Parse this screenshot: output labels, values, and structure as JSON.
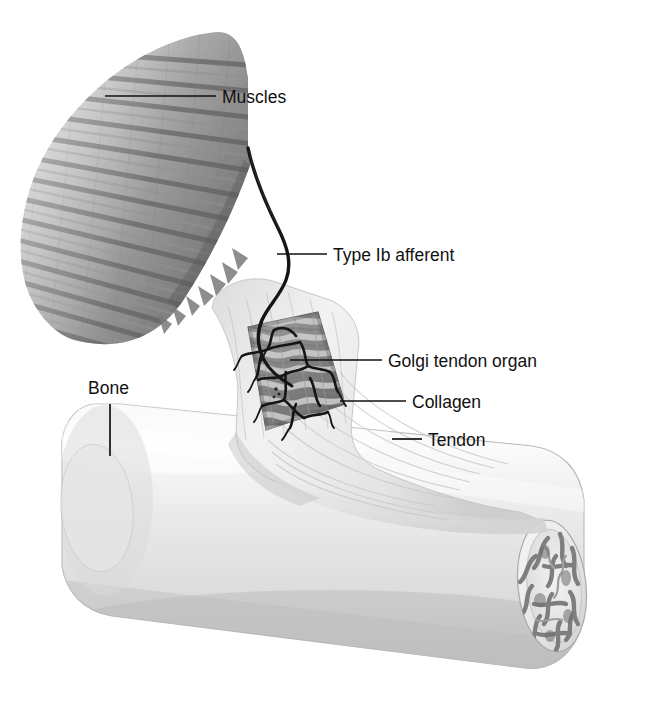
{
  "figure": {
    "name": "golgi-tendon-organ-diagram",
    "background_color": "#ffffff",
    "width": 647,
    "height": 710
  },
  "labels": [
    {
      "id": "muscles",
      "text": "Muscles",
      "text_x": 222,
      "text_y": 103,
      "leader": {
        "x1": 105,
        "y1": 96,
        "x2": 216,
        "y2": 96
      }
    },
    {
      "id": "type-ib-afferent",
      "text": "Type Ib afferent",
      "text_x": 333,
      "text_y": 261,
      "leader": {
        "x1": 277,
        "y1": 254,
        "x2": 327,
        "y2": 254
      }
    },
    {
      "id": "golgi-tendon-organ",
      "text": "Golgi tendon organ",
      "text_x": 388,
      "text_y": 367,
      "leader": {
        "x1": 290,
        "y1": 360,
        "x2": 382,
        "y2": 360
      }
    },
    {
      "id": "collagen",
      "text": "Collagen",
      "text_x": 412,
      "text_y": 408,
      "leader": {
        "x1": 340,
        "y1": 401,
        "x2": 406,
        "y2": 401
      }
    },
    {
      "id": "tendon",
      "text": "Tendon",
      "text_x": 428,
      "text_y": 446,
      "leader": {
        "x1": 392,
        "y1": 439,
        "x2": 422,
        "y2": 439
      }
    },
    {
      "id": "bone",
      "text": "Bone",
      "text_x": 88,
      "text_y": 394,
      "leader": {
        "x1": 110,
        "y1": 404,
        "x2": 110,
        "y2": 456
      }
    }
  ],
  "structures": {
    "muscle": {
      "name": "Muscles",
      "description": "pennate muscle belly with diagonal striated fibers fading toward upper left",
      "fiber_color_dark": "#7b7b7b",
      "fiber_color_light": "#cfcfcf",
      "fiber_count": 26
    },
    "nerve": {
      "name": "Type Ib afferent",
      "description": "thick dark axon descending from muscle into the tendon organ, branching into sensory endings",
      "color": "#1a1a1a",
      "stroke_width": 3.2
    },
    "golgi_organ": {
      "name": "Golgi tendon organ",
      "description": "rectangular cutaway window in tendon exposing collagen bundles and nerve endings",
      "window_fill": "#8e8e8e"
    },
    "collagen": {
      "name": "Collagen",
      "description": "wavy interwoven collagen fascicles inside the cutaway window",
      "color_dark": "#6e6e6e",
      "color_light": "#d6d6d6"
    },
    "tendon": {
      "name": "Tendon",
      "description": "pale fibrous band running from muscle down and fanning onto the bone surface",
      "fill": "#ededed",
      "fiber_color": "#d2d2d2"
    },
    "bone": {
      "name": "Bone",
      "description": "long cylindrical bone tilted from upper-left to lower-right with elliptical cut end",
      "fill": "#e9e9e9",
      "shadow": "#c4c4c4",
      "cut_face_fill": "#efefef",
      "trabecular_color": "#8a8a8a"
    }
  }
}
